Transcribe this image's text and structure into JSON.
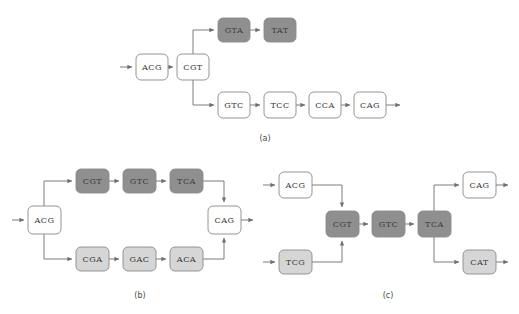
{
  "figure": {
    "width": 519,
    "height": 314,
    "background": "#ffffff"
  },
  "colors": {
    "node_white": "#fefefe",
    "node_light_gray": "#d6d6d6",
    "node_dark_gray": "#8f8f8f",
    "node_border": "#8a8a8a",
    "edge": "#6e6e6e",
    "text": "#3a3a3a"
  },
  "panels": [
    {
      "id": "a",
      "label": "(a)",
      "label_x": 265,
      "label_y": 138,
      "nodes": [
        {
          "name": "a-acg",
          "text": "ACG",
          "x": 136,
          "y": 54,
          "w": 32,
          "h": 26,
          "fill": "#fefefe"
        },
        {
          "name": "a-cgt",
          "text": "CGT",
          "x": 177,
          "y": 54,
          "w": 32,
          "h": 26,
          "fill": "#fefefe"
        },
        {
          "name": "a-gta",
          "text": "GTA",
          "x": 218,
          "y": 18,
          "w": 32,
          "h": 24,
          "fill": "#8f8f8f"
        },
        {
          "name": "a-tat",
          "text": "TAT",
          "x": 264,
          "y": 18,
          "w": 32,
          "h": 24,
          "fill": "#8f8f8f"
        },
        {
          "name": "a-gtc",
          "text": "GTC",
          "x": 218,
          "y": 92,
          "w": 32,
          "h": 26,
          "fill": "#fefefe"
        },
        {
          "name": "a-tcc",
          "text": "TCC",
          "x": 264,
          "y": 92,
          "w": 32,
          "h": 26,
          "fill": "#fefefe"
        },
        {
          "name": "a-cca",
          "text": "CCA",
          "x": 309,
          "y": 92,
          "w": 32,
          "h": 26,
          "fill": "#fefefe"
        },
        {
          "name": "a-cag",
          "text": "CAG",
          "x": 354,
          "y": 92,
          "w": 32,
          "h": 26,
          "fill": "#fefefe"
        }
      ]
    },
    {
      "id": "b",
      "label": "(b)",
      "label_x": 140,
      "label_y": 295,
      "nodes": [
        {
          "name": "b-acg",
          "text": "ACG",
          "x": 28,
          "y": 206,
          "w": 33,
          "h": 28,
          "fill": "#fefefe"
        },
        {
          "name": "b-cgt",
          "text": "CGT",
          "x": 76,
          "y": 169,
          "w": 33,
          "h": 24,
          "fill": "#8f8f8f",
          "bold_index": -1
        },
        {
          "name": "b-gtc",
          "text": "GTC",
          "x": 123,
          "y": 169,
          "w": 33,
          "h": 24,
          "fill": "#8f8f8f",
          "bold_index": 1
        },
        {
          "name": "b-tca",
          "text": "TCA",
          "x": 170,
          "y": 169,
          "w": 33,
          "h": 24,
          "fill": "#8f8f8f",
          "bold_index": -1
        },
        {
          "name": "b-cga",
          "text": "CGA",
          "x": 76,
          "y": 247,
          "w": 33,
          "h": 24,
          "fill": "#d6d6d6",
          "bold_index": -1
        },
        {
          "name": "b-gac",
          "text": "GAC",
          "x": 123,
          "y": 247,
          "w": 33,
          "h": 24,
          "fill": "#d6d6d6",
          "bold_index": 1
        },
        {
          "name": "b-aca",
          "text": "ACA",
          "x": 170,
          "y": 247,
          "w": 33,
          "h": 24,
          "fill": "#d6d6d6",
          "bold_index": 0
        },
        {
          "name": "b-cag",
          "text": "CAG",
          "x": 208,
          "y": 206,
          "w": 33,
          "h": 28,
          "fill": "#fefefe"
        }
      ]
    },
    {
      "id": "c",
      "label": "(c)",
      "label_x": 388,
      "label_y": 295,
      "nodes": [
        {
          "name": "c-acg",
          "text": "ACG",
          "x": 279,
          "y": 172,
          "w": 33,
          "h": 26,
          "fill": "#fefefe"
        },
        {
          "name": "c-tcg",
          "text": "TCG",
          "x": 279,
          "y": 250,
          "w": 33,
          "h": 24,
          "fill": "#d6d6d6"
        },
        {
          "name": "c-cgt",
          "text": "CGT",
          "x": 326,
          "y": 211,
          "w": 33,
          "h": 26,
          "fill": "#8f8f8f"
        },
        {
          "name": "c-gtc",
          "text": "GTC",
          "x": 372,
          "y": 211,
          "w": 33,
          "h": 26,
          "fill": "#8f8f8f"
        },
        {
          "name": "c-tca",
          "text": "TCA",
          "x": 418,
          "y": 211,
          "w": 33,
          "h": 26,
          "fill": "#8f8f8f"
        },
        {
          "name": "c-cag",
          "text": "CAG",
          "x": 463,
          "y": 172,
          "w": 33,
          "h": 26,
          "fill": "#fefefe"
        },
        {
          "name": "c-cat",
          "text": "CAT",
          "x": 463,
          "y": 250,
          "w": 33,
          "h": 24,
          "fill": "#d6d6d6"
        }
      ]
    }
  ],
  "edges_note": "directed arrows connecting nodes within each panel"
}
